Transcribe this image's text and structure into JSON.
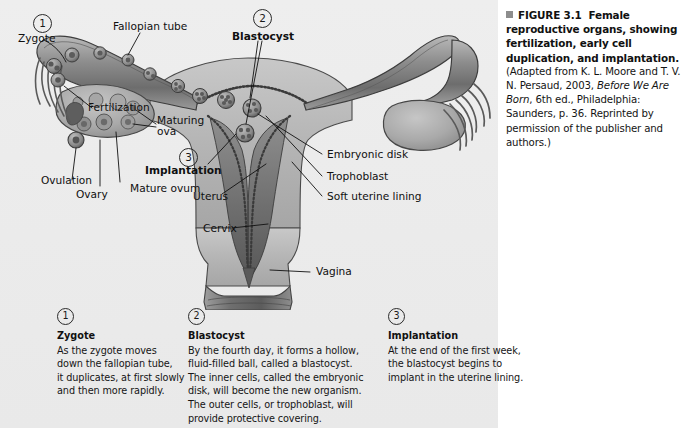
{
  "figure": {
    "panel_bg": "#ececec",
    "page_bg": "#ffffff",
    "ink": "#1a1a1a"
  },
  "caption": {
    "marker": "square-bullet-icon",
    "label": "FIGURE 3.1",
    "title": "Female reproductive organs, showing fertilization, early cell duplication, and implantation.",
    "source_pre": "(Adapted from K. L. Moore and T. V. N. Persaud, 2003, ",
    "source_italic": "Before We Are Born",
    "source_post": ", 6th ed., Philadelphia: Saunders, p. 36. Reprinted by permission of the publisher and authors.)"
  },
  "diagram": {
    "callouts": [
      {
        "number": "1",
        "label": "Zygote"
      },
      {
        "number": "2",
        "label": "Blastocyst"
      },
      {
        "number": "3",
        "label": "Implantation"
      }
    ],
    "labels": [
      {
        "id": "zygote",
        "text": "Zygote"
      },
      {
        "id": "fallopian-tube",
        "text": "Fallopian tube"
      },
      {
        "id": "blastocyst",
        "text": "Blastocyst"
      },
      {
        "id": "fertilization",
        "text": "Fertilization"
      },
      {
        "id": "maturing-ova-line1",
        "text": "Maturing"
      },
      {
        "id": "maturing-ova-line2",
        "text": "ova"
      },
      {
        "id": "implantation",
        "text": "Implantation"
      },
      {
        "id": "embryonic-disk",
        "text": "Embryonic disk"
      },
      {
        "id": "trophoblast",
        "text": "Trophoblast"
      },
      {
        "id": "soft-uterine-lining",
        "text": "Soft uterine lining"
      },
      {
        "id": "ovulation",
        "text": "Ovulation"
      },
      {
        "id": "ovary",
        "text": "Ovary"
      },
      {
        "id": "mature-ovum",
        "text": "Mature ovum"
      },
      {
        "id": "uterus",
        "text": "Uterus"
      },
      {
        "id": "cervix",
        "text": "Cervix"
      },
      {
        "id": "vagina",
        "text": "Vagina"
      }
    ]
  },
  "columns": [
    {
      "number": "1",
      "title": "Zygote",
      "lines": [
        "As the zygote moves",
        "down the fallopian tube,",
        "it duplicates, at first slowly",
        "and then more rapidly."
      ]
    },
    {
      "number": "2",
      "title": "Blastocyst",
      "lines": [
        "By the fourth day, it forms a hollow,",
        "fluid-filled ball, called a blastocyst.",
        "The inner cells, called the embryonic",
        "disk, will become the new organism.",
        "The outer cells, or trophoblast, will",
        "provide protective covering."
      ]
    },
    {
      "number": "3",
      "title": "Implantation",
      "lines": [
        "At the end of the first week,",
        "the blastocyst begins to",
        "implant in the uterine lining."
      ]
    }
  ]
}
